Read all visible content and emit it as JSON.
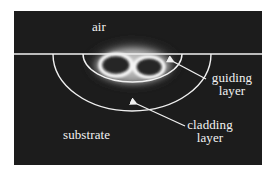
{
  "figure": {
    "labels": {
      "air": "air",
      "guiding_line1": "guiding",
      "guiding_line2": "layer",
      "cladding_line1": "cladding",
      "cladding_line2": "layer",
      "substrate": "substrate"
    },
    "colors": {
      "background": "#ffffff",
      "panel": "#1c1c1c",
      "lines": "#f0f0f0",
      "text": "#f2f2f2",
      "glow": "#e8e8e8"
    },
    "regions": [
      "air",
      "guiding layer",
      "cladding layer",
      "substrate"
    ]
  }
}
